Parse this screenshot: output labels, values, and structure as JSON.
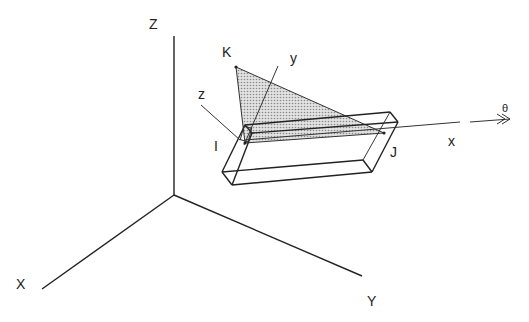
{
  "diagram": {
    "global_axes": {
      "X_label": "X",
      "Y_label": "Y",
      "Z_label": "Z"
    },
    "local_axes": {
      "x_label": "x",
      "y_label": "y",
      "z_label": "z"
    },
    "nodes": {
      "I_label": "I",
      "J_label": "J",
      "K_label": "K"
    },
    "rotation_label": "θ",
    "colors": {
      "line": "#222222",
      "triangle_fill": "#c8c8c8"
    }
  }
}
